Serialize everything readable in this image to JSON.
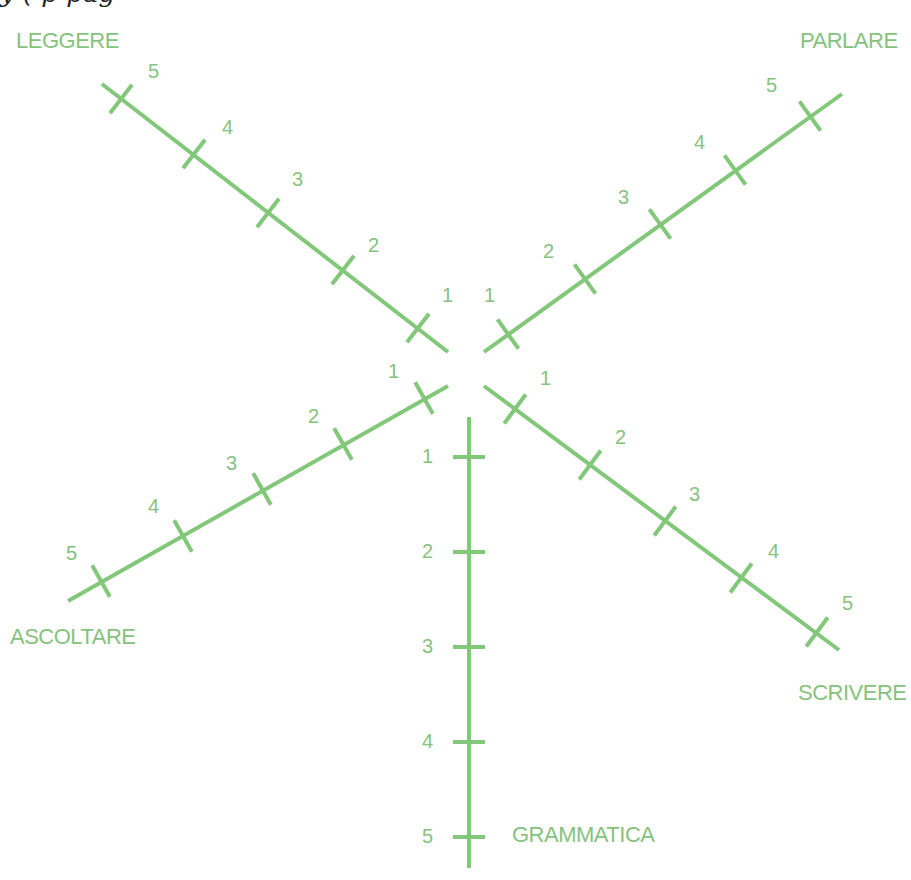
{
  "header_fragment": "y                     (      p              pag",
  "colors": {
    "accent": "#82c77a",
    "text": "#86c27e"
  },
  "axes": [
    {
      "name": "LEGGERE",
      "label_pos": [
        16,
        48
      ],
      "start": [
        448,
        352
      ],
      "end": [
        102,
        84
      ],
      "ticks": [
        [
          418,
          328
        ],
        [
          343,
          270
        ],
        [
          268,
          213
        ],
        [
          194,
          154
        ],
        [
          121,
          99
        ]
      ],
      "num_pos": [
        [
          442,
          302
        ],
        [
          368,
          252
        ],
        [
          292,
          186
        ],
        [
          222,
          134
        ],
        [
          148,
          78
        ]
      ]
    },
    {
      "name": "PARLARE",
      "label_pos": [
        800,
        48
      ],
      "start": [
        484,
        352
      ],
      "end": [
        842,
        94
      ],
      "ticks": [
        [
          508,
          334
        ],
        [
          585,
          279
        ],
        [
          660,
          224
        ],
        [
          735,
          170
        ],
        [
          810,
          116
        ]
      ],
      "num_pos": [
        [
          484,
          302
        ],
        [
          543,
          258
        ],
        [
          618,
          204
        ],
        [
          694,
          149
        ],
        [
          766,
          92
        ]
      ]
    },
    {
      "name": "ASCOLTARE",
      "label_pos": [
        10,
        644
      ],
      "start": [
        448,
        386
      ],
      "end": [
        68,
        601
      ],
      "ticks": [
        [
          424,
          398
        ],
        [
          343,
          444
        ],
        [
          262,
          489
        ],
        [
          183,
          536
        ],
        [
          101,
          581
        ]
      ],
      "num_pos": [
        [
          388,
          378
        ],
        [
          308,
          423
        ],
        [
          226,
          470
        ],
        [
          148,
          513
        ],
        [
          66,
          560
        ]
      ]
    },
    {
      "name": "SCRIVERE",
      "label_pos": [
        798,
        700
      ],
      "start": [
        484,
        386
      ],
      "end": [
        839,
        650
      ],
      "ticks": [
        [
          515,
          409
        ],
        [
          590,
          465
        ],
        [
          665,
          521
        ],
        [
          741,
          578
        ],
        [
          817,
          632
        ]
      ],
      "num_pos": [
        [
          540,
          385
        ],
        [
          615,
          444
        ],
        [
          689,
          501
        ],
        [
          768,
          558
        ],
        [
          842,
          610
        ]
      ]
    },
    {
      "name": "GRAMMATICA",
      "label_pos": [
        512,
        842
      ],
      "start": [
        469,
        417
      ],
      "end": [
        469,
        868
      ],
      "ticks": [
        [
          469,
          457
        ],
        [
          469,
          552
        ],
        [
          469,
          647
        ],
        [
          469,
          742
        ],
        [
          469,
          837
        ]
      ],
      "num_pos": [
        [
          422,
          463
        ],
        [
          422,
          558
        ],
        [
          422,
          653
        ],
        [
          422,
          748
        ],
        [
          422,
          843
        ]
      ]
    }
  ],
  "tick_values": [
    "1",
    "2",
    "3",
    "4",
    "5"
  ]
}
